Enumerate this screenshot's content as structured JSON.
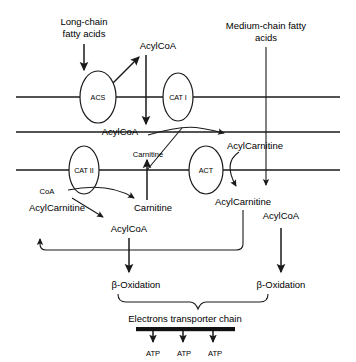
{
  "diagram": {
    "colors": {
      "stroke": "#1a1a1a",
      "text": "#000000",
      "background": "#ffffff",
      "bar": "#111111"
    },
    "inputs": {
      "long_chain": "Long-chain\nfatty acids",
      "long_chain_line1": "Long-chain",
      "long_chain_line2": "fatty acids",
      "medium_chain_line1": "Medium-chain fatty",
      "medium_chain_line2": "acids"
    },
    "enzymes": [
      {
        "id": "acs",
        "label": "ACS",
        "membrane": "outer"
      },
      {
        "id": "cat1",
        "label": "CAT I",
        "membrane": "outer"
      },
      {
        "id": "cat2",
        "label": "CAT II",
        "membrane": "inner"
      },
      {
        "id": "act",
        "label": "ACT",
        "membrane": "inner"
      }
    ],
    "metabolites": {
      "acylcoa_top": "AcylCoA",
      "acylcoa_intermembrane": "AcylCoA",
      "acylcarnitine_intermembrane": "AcylCarnitine",
      "carnitine_intermembrane": "Carnitine",
      "carnitine_matrix": "Carnitine",
      "coa_matrix": "CoA",
      "acylcarnitine_matrix_left": "AcylCarnitine",
      "acylcoa_matrix_left": "AcylCoA",
      "acylcarnitine_matrix_right": "AcylCarnitine",
      "acylcoa_matrix_right": "AcylCoA"
    },
    "oxidation": {
      "left_label": "β-Oxidation",
      "right_label": "β-Oxidation"
    },
    "electron_chain": {
      "label": "Electrons transporter chain"
    },
    "atp_outputs": [
      "ATP",
      "ATP",
      "ATP"
    ],
    "membranes": [
      {
        "id": "outer-top",
        "y": 97
      },
      {
        "id": "outer-bottom",
        "y": 132
      },
      {
        "id": "inner",
        "y": 170
      }
    ]
  }
}
